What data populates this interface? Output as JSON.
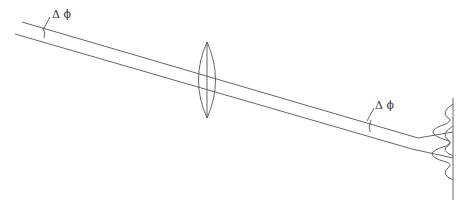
{
  "figure": {
    "labels": {
      "angle_left": "Δ ϕ",
      "angle_right": "Δ ϕ"
    },
    "colors": {
      "stroke": "#555555",
      "background": "#ffffff"
    }
  }
}
